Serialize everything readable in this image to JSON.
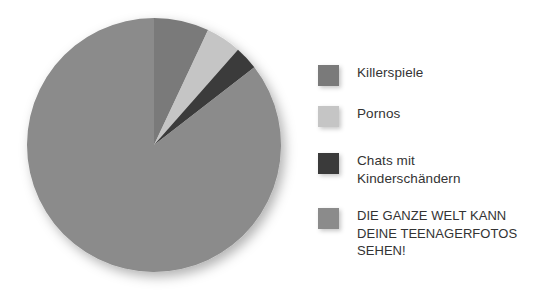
{
  "chart_data": {
    "type": "pie",
    "title": "",
    "subtitle": "",
    "xlabel": "",
    "ylabel": "",
    "legend_position": "right",
    "grid": false,
    "start_angle_deg": 0,
    "direction": "clockwise",
    "categories": [
      "Killerspiele",
      "Pornos",
      "Chats mit Kinderschändern",
      "DIE GANZE WELT KANN DEINE TEENAGERFOTOS SEHEN!"
    ],
    "values": [
      7.0,
      4.5,
      3.0,
      85.5
    ],
    "angles_deg": [
      25.2,
      16.2,
      10.8,
      307.8
    ],
    "colors": [
      "#7a7a7a",
      "#c5c5c5",
      "#3a3a3a",
      "#8b8b8b"
    ],
    "slices": [
      {
        "label": "Killerspiele",
        "value": 7.0,
        "angle_deg": 25.2,
        "color": "#7a7a7a"
      },
      {
        "label": "Pornos",
        "value": 4.5,
        "angle_deg": 16.2,
        "color": "#c5c5c5"
      },
      {
        "label": "Chats mit Kinderschändern",
        "value": 3.0,
        "angle_deg": 10.8,
        "color": "#3a3a3a"
      },
      {
        "label": "DIE GANZE WELT KANN DEINE TEENAGERFOTOS SEHEN!",
        "value": 85.5,
        "angle_deg": 307.8,
        "color": "#8b8b8b"
      }
    ]
  },
  "legend": {
    "items": [
      {
        "label": "Killerspiele",
        "color": "#7a7a7a",
        "swatch_name": "legend-swatch-killerspiele"
      },
      {
        "label": "Pornos",
        "color": "#c5c5c5",
        "swatch_name": "legend-swatch-pornos"
      },
      {
        "label": "Chats mit\nKinderschändern",
        "color": "#3a3a3a",
        "swatch_name": "legend-swatch-chats"
      },
      {
        "label": "DIE GANZE WELT KANN\nDEINE TEENAGERFOTOS\nSEHEN!",
        "color": "#8b8b8b",
        "swatch_name": "legend-swatch-teenagerfotos"
      }
    ]
  },
  "canvas": {
    "background": "#ffffff",
    "text_color": "#333333"
  }
}
